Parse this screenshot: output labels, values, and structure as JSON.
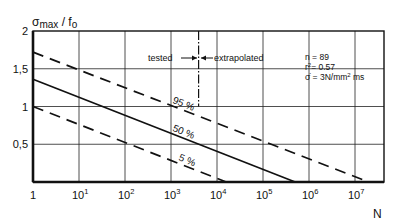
{
  "chart_data": {
    "type": "line",
    "title": "",
    "ylabel": "σmax / fo",
    "ylabel_parts": {
      "main": "σ",
      "sub1": "max",
      "sep": " / ",
      "main2": "f",
      "sub2": "o"
    },
    "xlabel": "N",
    "xscale": "log",
    "xlim_log10": [
      0,
      7.6
    ],
    "ylim": [
      0,
      2
    ],
    "grid": true,
    "x_ticks": [
      {
        "log": 0,
        "label": "1",
        "exp": ""
      },
      {
        "log": 1,
        "label": "10",
        "exp": "1"
      },
      {
        "log": 2,
        "label": "10",
        "exp": "2"
      },
      {
        "log": 3,
        "label": "10",
        "exp": "3"
      },
      {
        "log": 4,
        "label": "10",
        "exp": "4"
      },
      {
        "log": 5,
        "label": "10",
        "exp": "5"
      },
      {
        "log": 6,
        "label": "10",
        "exp": "6"
      },
      {
        "log": 7,
        "label": "10",
        "exp": "7"
      }
    ],
    "y_ticks": [
      {
        "value": 0.5,
        "label": "0,5"
      },
      {
        "value": 1.0,
        "label": "1"
      },
      {
        "value": 1.5,
        "label": "1,5"
      },
      {
        "value": 2.0,
        "label": "2"
      }
    ],
    "series": [
      {
        "name": "95 %",
        "style": "dashed",
        "log10N": [
          0,
          7.3
        ],
        "values": [
          1.72,
          0.0
        ]
      },
      {
        "name": "50 %",
        "style": "solid",
        "log10N": [
          0,
          5.7
        ],
        "values": [
          1.36,
          0.0
        ]
      },
      {
        "name": "5 %",
        "style": "dashed",
        "log10N": [
          0,
          4.2
        ],
        "values": [
          1.0,
          0.0
        ]
      }
    ],
    "annotations": {
      "divider": {
        "log10N": 3.6,
        "y_from": 1.0,
        "y_to": 2.0,
        "style": "dash-dot"
      },
      "tested_label": "tested",
      "extrapolated_label": "extrapolated",
      "stats": {
        "n": "n = 89",
        "r2_prefix": "r",
        "r2_exp": "2",
        "r2_value": "= 0.57",
        "rate_prefix": "σ̇ = 3N/mm",
        "rate_exp": "2",
        "rate_suffix": " ms"
      }
    }
  }
}
